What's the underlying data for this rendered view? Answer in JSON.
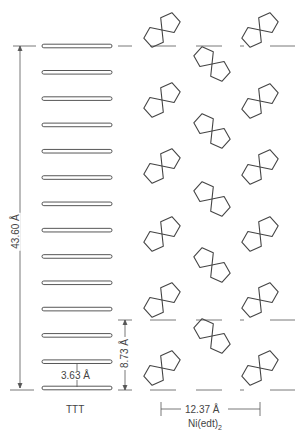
{
  "labels": {
    "total_height": "43.60 Å",
    "stack_spacing": "3.63 Å",
    "cell_height": "8.73 Å",
    "cell_width": "12.37 Å",
    "ttt": "TTT",
    "nickel_complex": "Ni(edt)",
    "nickel_subscript": "2"
  },
  "ttt_bars": {
    "count": 14,
    "x": 42,
    "width": 70,
    "y": [
      46,
      76,
      103,
      131,
      160,
      188,
      217,
      245,
      273,
      301,
      329,
      358,
      387,
      390
    ]
  },
  "molecules": {
    "left_column": {
      "x": 162,
      "orientation": "slash",
      "y": [
        30,
        100,
        166,
        234,
        300,
        368
      ]
    },
    "middle_column": {
      "x": 212,
      "orientation": "backslash",
      "y": [
        64,
        131,
        199,
        265,
        336
      ]
    },
    "right_column": {
      "x": 260,
      "orientation": "slash",
      "y": [
        30,
        101,
        167,
        234,
        300,
        368
      ]
    }
  },
  "colors": {
    "line": "#444444",
    "bar_fill": "#ffffff",
    "background": "#ffffff"
  }
}
